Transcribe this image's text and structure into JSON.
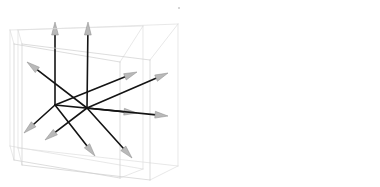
{
  "figure": {
    "title": "",
    "type": "vector-diagram",
    "width": 380,
    "height": 187,
    "background": "#ffffff",
    "panel_count": 2,
    "artifact_speck": {
      "x": 178,
      "y": 7,
      "color": "#c9c9c9"
    }
  },
  "style": {
    "box_stroke": "#cfcfcf",
    "box_stroke_back": "#dedede",
    "box_fill": "none",
    "box_stroke_width": 0.7,
    "vector_stroke": "#141414",
    "vector_stroke_width": 1.6,
    "arrowhead_fill": "#b9b9b9",
    "arrowhead_stroke": "#8a8a8a",
    "arrowhead_stroke_width": 0.5
  },
  "panels": [
    {
      "id": "panel-left",
      "name": "left-vector-box",
      "origin": {
        "x": 55,
        "y": 105
      },
      "box": {
        "front_bottom_left": {
          "x": 14,
          "y": 160
        },
        "front_bottom_right": {
          "x": 120,
          "y": 178
        },
        "front_top_right": {
          "x": 120,
          "y": 62
        },
        "front_top_left": {
          "x": 14,
          "y": 44
        },
        "back_bottom_left": {
          "x": 10,
          "y": 146
        },
        "back_bottom_right": {
          "x": 143,
          "y": 169
        },
        "back_top_right": {
          "x": 143,
          "y": 26
        },
        "back_top_left": {
          "x": 10,
          "y": 30
        }
      },
      "vectors": [
        {
          "name": "vector-up",
          "tip": {
            "x": 55,
            "y": 22
          }
        },
        {
          "name": "vector-upper-right",
          "tip": {
            "x": 137,
            "y": 72
          }
        },
        {
          "name": "vector-right",
          "tip": {
            "x": 137,
            "y": 113
          }
        },
        {
          "name": "vector-lower-left",
          "tip": {
            "x": 24,
            "y": 133
          }
        },
        {
          "name": "vector-lower-right",
          "tip": {
            "x": 95,
            "y": 156
          }
        }
      ],
      "vector_count": 5
    },
    {
      "id": "panel-right",
      "name": "right-vector-box",
      "origin": {
        "x": 87,
        "y": 108
      },
      "box": {
        "front_bottom_left": {
          "x": 22,
          "y": 165
        },
        "front_bottom_right": {
          "x": 150,
          "y": 180
        },
        "front_top_right": {
          "x": 150,
          "y": 60
        },
        "front_top_left": {
          "x": 22,
          "y": 44
        },
        "back_bottom_left": {
          "x": 18,
          "y": 148
        },
        "back_bottom_right": {
          "x": 178,
          "y": 166
        },
        "back_top_right": {
          "x": 178,
          "y": 24
        },
        "back_top_left": {
          "x": 18,
          "y": 30
        }
      },
      "vectors": [
        {
          "name": "vector-up",
          "tip": {
            "x": 88,
            "y": 22
          }
        },
        {
          "name": "vector-upper-left",
          "tip": {
            "x": 27,
            "y": 62
          }
        },
        {
          "name": "vector-upper-right",
          "tip": {
            "x": 168,
            "y": 73
          }
        },
        {
          "name": "vector-right",
          "tip": {
            "x": 168,
            "y": 116
          }
        },
        {
          "name": "vector-lower-left",
          "tip": {
            "x": 45,
            "y": 140
          }
        },
        {
          "name": "vector-lower-right",
          "tip": {
            "x": 132,
            "y": 158
          }
        }
      ],
      "vector_count": 6
    }
  ]
}
